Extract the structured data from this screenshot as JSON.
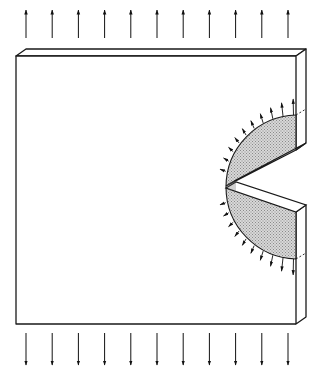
{
  "diagram": {
    "colors": {
      "line": "#1a1a1a",
      "stipple_fg": "#8a8a8a",
      "stipple_bg": "#d8d8d8",
      "background": "#ffffff"
    },
    "top_arrows": {
      "count": 11,
      "x_start": 26,
      "x_end": 288,
      "y_tail": 38,
      "y_head": 10,
      "direction": "up"
    },
    "bottom_arrows": {
      "count": 11,
      "x_start": 26,
      "x_end": 288,
      "y_tail": 333,
      "y_head": 365,
      "direction": "down"
    },
    "plate": {
      "front_left": 16,
      "front_top": 51,
      "front_right": 296,
      "front_bottom": 324,
      "depth_dx": 10,
      "depth_dy": -7
    },
    "crack": {
      "mouth_x": 296,
      "tip_x": 225,
      "tip_y": 187,
      "upper_mouth_y": 152,
      "lower_mouth_y": 204
    },
    "zone": {
      "center_x": 296,
      "center_y": 187,
      "radius": 72
    },
    "radial_arrow_count": 22
  }
}
